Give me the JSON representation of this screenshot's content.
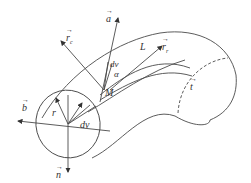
{
  "diagram": {
    "type": "geometric-vector-diagram",
    "colors": {
      "stroke": "#4a4a4a",
      "background": "#ffffff",
      "text": "#333333"
    },
    "labels": {
      "a": "a",
      "r_c": "r",
      "r_c_sub": "c",
      "L": "L",
      "r_r": "r",
      "r_r_sub": "r",
      "dv_top": "dv",
      "alpha": "α",
      "M": "M",
      "t": "t",
      "b": "b",
      "r": "r",
      "dv_bottom": "dv",
      "n": "n"
    }
  }
}
